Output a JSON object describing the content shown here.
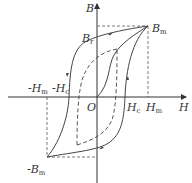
{
  "diagram": {
    "colors": {
      "curve": "#444444",
      "axis": "#333333",
      "dashed": "#555555",
      "background": "#ffffff"
    },
    "axes": {
      "x_label": "H",
      "y_label": "B",
      "origin_label": "O"
    },
    "labels": {
      "Br": {
        "main": "B",
        "sub": "r"
      },
      "Bm": {
        "main": "B",
        "sub": "m"
      },
      "neg_Bm": {
        "main": "-B",
        "sub": "m"
      },
      "Hc": {
        "main": "H",
        "sub": "c"
      },
      "Hm": {
        "main": "H",
        "sub": "m"
      },
      "neg_Hm": {
        "main": "-H",
        "sub": "m"
      },
      "neg_Hc": {
        "main": "-H",
        "sub": "c"
      }
    },
    "curves": [
      {
        "name": "major-hysteresis-loop",
        "style": "solid"
      },
      {
        "name": "initial-magnetization-curve",
        "style": "solid"
      },
      {
        "name": "minor-loop",
        "style": "dashed"
      }
    ]
  }
}
